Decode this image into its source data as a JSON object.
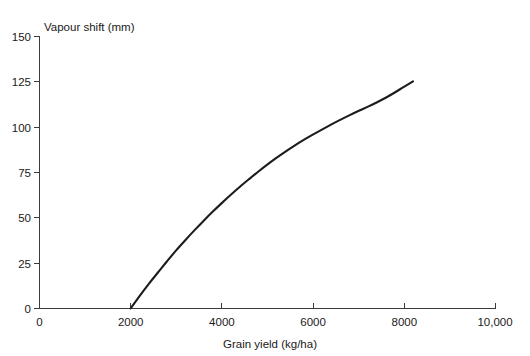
{
  "chart_data": {
    "type": "line",
    "title": "",
    "xlabel": "Grain yield (kg/ha)",
    "ylabel": "Vapour shift (mm)",
    "xlim": [
      0,
      10000
    ],
    "ylim": [
      0,
      150
    ],
    "grid": false,
    "legend": false,
    "x_ticks": [
      0,
      2000,
      4000,
      6000,
      8000,
      10000
    ],
    "x_tick_labels": [
      "0",
      "2000",
      "4000",
      "6000",
      "8000",
      "10,000"
    ],
    "y_ticks": [
      0,
      25,
      50,
      75,
      100,
      125,
      150
    ],
    "y_tick_labels": [
      "0",
      "25",
      "50",
      "75",
      "100",
      "125",
      "150"
    ],
    "series": [
      {
        "name": "Vapour shift vs grain yield",
        "color": "#1c1c1c",
        "x": [
          2000,
          2200,
          2400,
          2600,
          2800,
          3000,
          3200,
          3400,
          3600,
          3800,
          4000,
          4200,
          4400,
          4600,
          4800,
          5000,
          5200,
          5400,
          5600,
          5800,
          6000,
          6200,
          6400,
          6600,
          6800,
          7000,
          7200,
          7400,
          7600,
          7800,
          8000,
          8200
        ],
        "y": [
          0,
          7.0,
          13.6,
          19.8,
          26.0,
          32.0,
          37.6,
          43.0,
          48.2,
          53.2,
          58.0,
          62.6,
          67.0,
          71.2,
          75.3,
          79.2,
          82.9,
          86.4,
          89.7,
          92.8,
          95.7,
          98.5,
          101.2,
          103.8,
          106.3,
          108.7,
          111.0,
          113.4,
          116.0,
          118.9,
          122.0,
          125.0
        ]
      }
    ],
    "annotations": []
  },
  "axes": {
    "y_title": "Vapour shift (mm)",
    "x_title": "Grain yield (kg/ha)"
  }
}
